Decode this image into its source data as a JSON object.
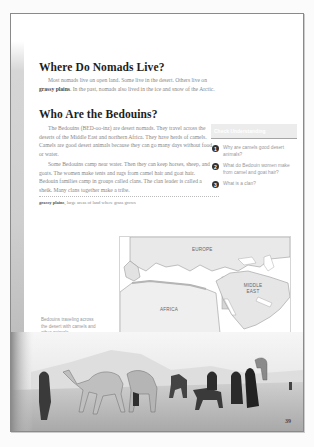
{
  "page": {
    "page_number": "39"
  },
  "sections": [
    {
      "heading": "Where Do Nomads Live?",
      "paragraphs": [
        {
          "before": "Most nomads live on open land. Some live in the desert. Others live on ",
          "term": "grassy plains",
          "after": ". In the past, nomads also lived in the ice and snow of the Arctic."
        }
      ]
    },
    {
      "heading": "Who Are the Bedouins?",
      "paragraphs": [
        {
          "text": "The Bedouins (BED-oo-inz) are desert nomads. They travel across the deserts of the Middle East and northern Africa. They have herds of camels. Camels are good desert animals because they can go many days without food or water."
        },
        {
          "text": "Some Bedouins camp near water. Then they can keep horses, sheep, and goats. The women make tents and rugs from camel hair and goat hair. Bedouin families camp in groups called clans. The clan leader is called a sheik. Many clans together make a tribe."
        }
      ]
    }
  ],
  "glossary": {
    "term": "grassy plains",
    "definition": "large areas of land where grass grows"
  },
  "questions_box": {
    "header": "Check Understanding",
    "items": [
      {
        "number": "1",
        "text": "Why are camels good desert animals?"
      },
      {
        "number": "2",
        "text": "What do Bedouin women make from camel and goat hair?"
      },
      {
        "number": "3",
        "text": "What is a clan?"
      }
    ]
  },
  "map": {
    "labels": {
      "europe": "EUROPE",
      "middle_east": "MIDDLE EAST",
      "africa": "AFRICA"
    },
    "colors": {
      "land": "#ececec",
      "sea": "#ffffff",
      "highlight": "#cfcfcf"
    }
  },
  "photo": {
    "caption": "Bedouins traveling across the desert with camels and other animals"
  }
}
